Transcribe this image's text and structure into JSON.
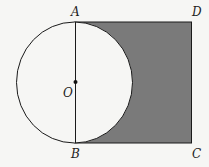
{
  "diagram": {
    "points": {
      "A": "A",
      "B": "B",
      "C": "C",
      "D": "D",
      "O": "O"
    },
    "colors": {
      "shade": "#7a7a7a",
      "stroke": "#1a1a1a",
      "circle_fill": "#f6f6f4"
    }
  }
}
